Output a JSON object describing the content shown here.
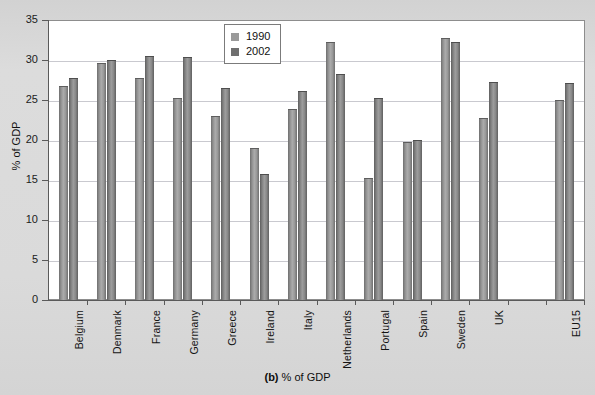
{
  "caption": {
    "prefix": "(b)",
    "text": " % of GDP"
  },
  "legend": {
    "position": "top-center",
    "items": [
      {
        "label": "1990",
        "color": "#9a9a9a"
      },
      {
        "label": "2002",
        "color": "#6f6f6f"
      }
    ]
  },
  "axes": {
    "ylabel": "% of GDP",
    "yticks": [
      "0",
      "5",
      "10",
      "15",
      "20",
      "25",
      "30",
      "35"
    ]
  },
  "chart_data": {
    "type": "bar",
    "title": "",
    "subtitle": "",
    "xlabel": "",
    "ylabel": "% of GDP",
    "ylim": [
      0,
      35
    ],
    "ytick_step": 5,
    "grid": true,
    "legend_position": "top-center",
    "categories": [
      "Belgium",
      "Denmark",
      "France",
      "Germany",
      "Greece",
      "Ireland",
      "Italy",
      "Netherlands",
      "Portugal",
      "Spain",
      "Sweden",
      "UK",
      "",
      "EU15"
    ],
    "series": [
      {
        "name": "1990",
        "values": [
          26.7,
          29.6,
          27.7,
          25.3,
          23.0,
          19.0,
          23.9,
          32.2,
          15.2,
          19.8,
          32.7,
          22.8,
          null,
          25.0
        ]
      },
      {
        "name": "2002",
        "values": [
          27.8,
          30.0,
          30.5,
          30.4,
          26.5,
          15.8,
          26.1,
          28.3,
          25.2,
          20.0,
          32.2,
          27.2,
          null,
          27.1
        ]
      }
    ]
  }
}
